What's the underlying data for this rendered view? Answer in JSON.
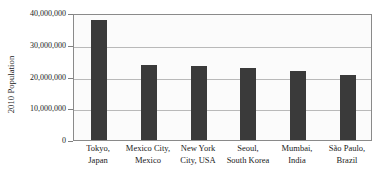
{
  "chart_data": {
    "type": "bar",
    "title": "",
    "xlabel": "",
    "ylabel": "2010 Population",
    "ylim": [
      0,
      40000000
    ],
    "grid": true,
    "legend": "none",
    "orientation": "vertical",
    "bar_color": "#3a3a3a",
    "categories": [
      "Tokyo, Japan",
      "Mexico City, Mexico",
      "New York City, USA",
      "Seoul, South Korea",
      "Mumbai, India",
      "São Paulo, Brazil"
    ],
    "category_lines": [
      {
        "line1": "Tokyo,",
        "line2": "Japan"
      },
      {
        "line1": "Mexico City,",
        "line2": "Mexico"
      },
      {
        "line1": "New York",
        "line2": "City, USA"
      },
      {
        "line1": "Seoul,",
        "line2": "South Korea"
      },
      {
        "line1": "Mumbai,",
        "line2": "India"
      },
      {
        "line1": "São Paulo,",
        "line2": "Brazil"
      }
    ],
    "values": [
      37800000,
      23600000,
      23300000,
      22600000,
      21700000,
      20500000
    ],
    "ytick_values": [
      0,
      10000000,
      20000000,
      30000000,
      40000000
    ],
    "ytick_labels": [
      "0",
      "10,000,000",
      "20,000,000",
      "30,000,000",
      "40,000,000"
    ]
  }
}
